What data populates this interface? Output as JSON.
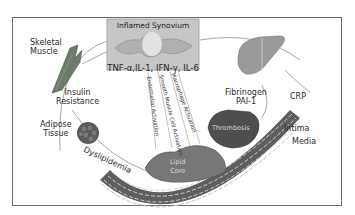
{
  "diagram": {
    "type": "inflammation-atherosclerosis-pathway",
    "center_box": {
      "title": "Inflamed Synovium",
      "cytokines": "TNF-α,IL-1, IFN-γ, IL-6"
    },
    "nodes": [
      {
        "id": "skeletal-muscle",
        "label_line1": "Skeletal",
        "label_line2": "Muscle"
      },
      {
        "id": "insulin-resistance",
        "label_line1": "Insulin",
        "label_line2": "Resistance"
      },
      {
        "id": "adipose-tissue",
        "label_line1": "Adipose",
        "label_line2": "Tissue"
      },
      {
        "id": "dyslipidemia",
        "label": "Dyslipidemia"
      },
      {
        "id": "liver",
        "label_line1": "Fibrinogen",
        "label_line2": "PAI-1"
      },
      {
        "id": "crp",
        "label": "CRP"
      },
      {
        "id": "thrombosis",
        "label": "Thrombosis"
      },
      {
        "id": "intima",
        "label": "Intima"
      },
      {
        "id": "media",
        "label": "Media"
      },
      {
        "id": "lipid-core",
        "label_line1": "Lipid",
        "label_line2": "Core"
      }
    ],
    "vascular_effects": [
      {
        "label": "Endothelial Activation"
      },
      {
        "label": "Smooth Muscle Cell Activation"
      },
      {
        "label": "Macrophage Activation"
      }
    ],
    "colors": {
      "frame": "#6e6e6e",
      "box": "#c8c8c8",
      "arcs": "#9a9a9a",
      "vessel": "#5a5a5a",
      "thrombus": "#4a4a4a"
    }
  }
}
